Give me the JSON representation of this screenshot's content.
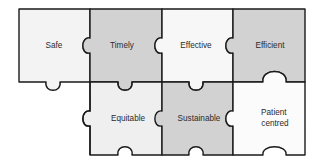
{
  "diagram": {
    "type": "jigsaw-puzzle",
    "background_color": "#ffffff",
    "stroke_color": "#1a1a1a",
    "text_color": "#2b2b2b",
    "rows": 2,
    "columns": 4,
    "pieces": [
      {
        "id": "safe",
        "label": "Safe",
        "row": 1,
        "column": 1,
        "fill": "#f3f3f3",
        "present": true
      },
      {
        "id": "timely",
        "label": "Timely",
        "row": 1,
        "column": 2,
        "fill": "#d2d2d2",
        "present": true
      },
      {
        "id": "effective",
        "label": "Effective",
        "row": 1,
        "column": 3,
        "fill": "#f7f7f7",
        "present": true
      },
      {
        "id": "efficient",
        "label": "Efficient",
        "row": 1,
        "column": 4,
        "fill": "#d2d2d2",
        "present": true
      },
      {
        "id": "empty-bottom-left",
        "label": "",
        "row": 2,
        "column": 1,
        "fill": "#ffffff",
        "present": false
      },
      {
        "id": "equitable",
        "label": "Equitable",
        "row": 2,
        "column": 2,
        "fill": "#efefef",
        "present": true
      },
      {
        "id": "sustainable",
        "label": "Sustainable",
        "row": 2,
        "column": 3,
        "fill": "#d2d2d2",
        "present": true
      },
      {
        "id": "patient-centred",
        "label": "Patient centred",
        "label_line1": "Patient",
        "label_line2": "centred",
        "row": 2,
        "column": 4,
        "fill": "#fbfbfb",
        "present": true
      }
    ]
  }
}
